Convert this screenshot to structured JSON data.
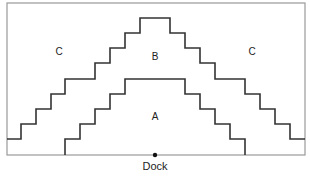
{
  "diagram": {
    "type": "zoned-staircase-layout",
    "frame": {
      "x": 7,
      "y": 3,
      "width": 298,
      "height": 152,
      "color": "#999999"
    },
    "boundary_color": "#333333",
    "regions": [
      {
        "id": "A",
        "label": "A",
        "x": 155,
        "y": 120
      },
      {
        "id": "B",
        "label": "B",
        "x": 155,
        "y": 60
      },
      {
        "id": "C-left",
        "label": "C",
        "x": 59,
        "y": 55
      },
      {
        "id": "C-right",
        "label": "C",
        "x": 252,
        "y": 55
      }
    ],
    "boundaries": {
      "outer_B_C": "7,139 21,139 21,124 36,124 36,109 51,109 51,94 65,94 65,79 95,79 95,63 110,63 110,48 125,48 125,33 140,33 140,18 170,18 170,33 185,33 185,48 200,48 200,63 215,63 215,79 245,79 245,94 260,94 260,109 275,109 275,124 290,124 290,139 305,139",
      "inner_A_B": "65,155 65,139 80,139 80,124 95,124 95,109 110,109 110,94 125,94 125,79 185,79 185,94 200,94 200,109 215,109 215,124 230,124 230,139 245,139 245,155"
    },
    "dock": {
      "label": "Dock",
      "x": 155,
      "y": 155
    }
  }
}
